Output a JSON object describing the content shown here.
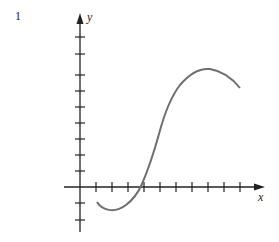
{
  "figure": {
    "number": "1",
    "x_axis_label": "x",
    "y_axis_label": "y"
  },
  "colors": {
    "axis": "#222222",
    "curve": "#6e6e6e"
  },
  "axes": {
    "origin_px": [
      80,
      187
    ],
    "tick_spacing_px": 16,
    "x_ticks_positive": 6,
    "y_ticks_positive": 9,
    "y_ticks_negative": 2
  },
  "curve": {
    "description": "smooth S-shaped curve: starts below x-axis, dips to a local minimum, rises steeply crossing x-axis, reaches a local maximum, then descends",
    "points_px": [
      [
        97,
        202
      ],
      [
        110,
        211
      ],
      [
        126,
        205
      ],
      [
        141,
        187
      ],
      [
        150,
        165
      ],
      [
        160,
        130
      ],
      [
        168,
        105
      ],
      [
        180,
        84
      ],
      [
        195,
        72
      ],
      [
        208,
        69
      ],
      [
        222,
        73
      ],
      [
        240,
        88
      ]
    ]
  }
}
